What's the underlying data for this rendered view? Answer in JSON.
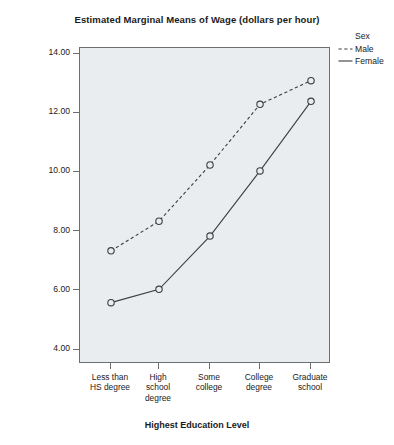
{
  "chart_data": {
    "type": "line",
    "title": "Estimated Marginal Means of Wage (dollars per hour)",
    "xlabel": "Highest Education Level",
    "ylabel": "Estimated Marginal Means",
    "categories": [
      "Less than\nHS degree",
      "High\nschool\ndegree",
      "Some\ncollege",
      "College\ndegree",
      "Graduate\nschool"
    ],
    "series": [
      {
        "name": "Male",
        "values": [
          7.35,
          8.35,
          10.25,
          12.3,
          13.1
        ],
        "style": "dashed",
        "marker": "open-circle",
        "color": "#3d3d3d"
      },
      {
        "name": "Female",
        "values": [
          5.6,
          6.05,
          7.85,
          10.05,
          12.4
        ],
        "style": "solid",
        "marker": "open-circle",
        "color": "#3d3d3d"
      }
    ],
    "ylim": [
      4.0,
      14.0
    ],
    "yticks": [
      4.0,
      6.0,
      8.0,
      10.0,
      12.0,
      14.0
    ],
    "ytick_labels": [
      "4.00",
      "6.00",
      "8.00",
      "10.00",
      "12.00",
      "14.00"
    ],
    "grid": false,
    "legend_position": "right",
    "legend_title": "Sex",
    "plot_background": "#e9edef",
    "frame_color": "#6e6e6e"
  },
  "legend": {
    "title": "Sex",
    "entries": [
      {
        "label": "Male",
        "style": "dashed"
      },
      {
        "label": "Female",
        "style": "solid"
      }
    ]
  }
}
